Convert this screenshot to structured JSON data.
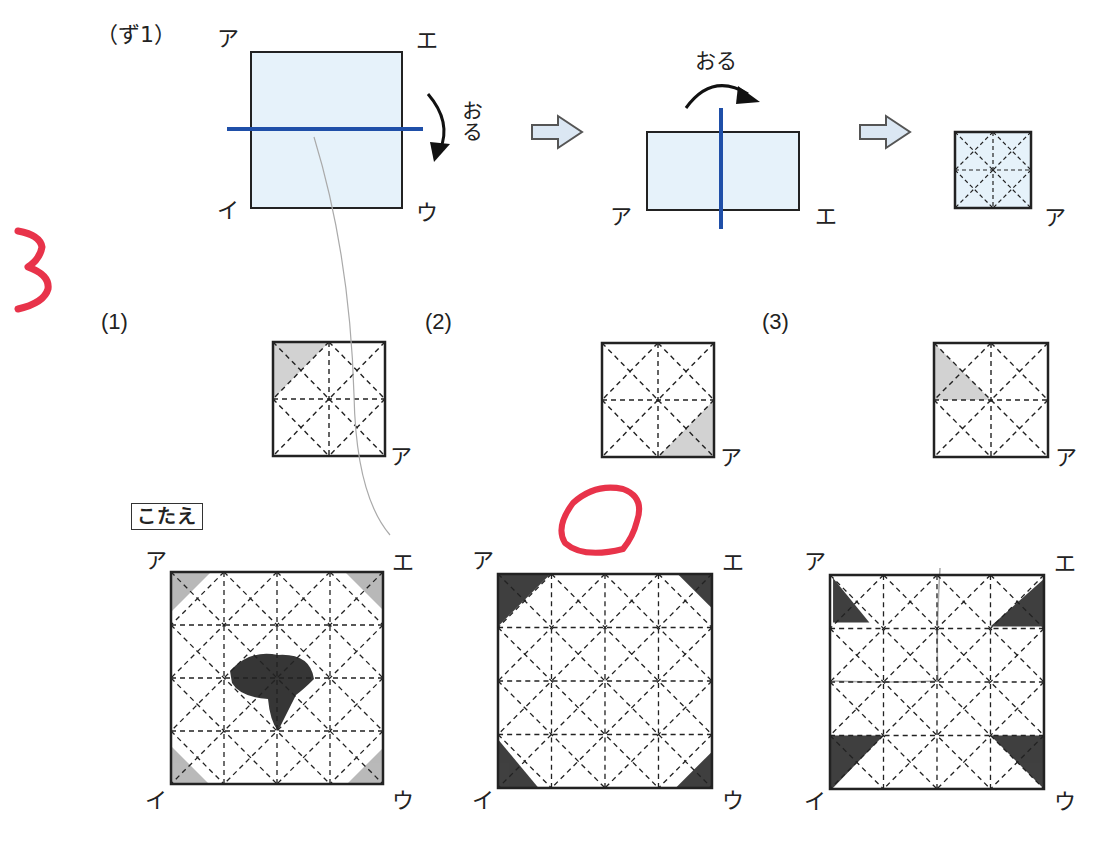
{
  "figure": {
    "title": "（ず1）",
    "fold_label": "おる",
    "step1": {
      "corners": {
        "top_left": "ア",
        "top_right": "エ",
        "bottom_left": "イ",
        "bottom_right": "ウ"
      }
    },
    "step2": {
      "corners": {
        "bottom_left": "ア",
        "bottom_right": "エ"
      }
    },
    "step3": {
      "corner": "ア"
    },
    "colors": {
      "paper": "#e6f2fa",
      "fold_line": "#1f4fa8",
      "arrow_fill": "#dbe7f3",
      "shade": "#d2d2d2"
    }
  },
  "problem_number_mark": "3",
  "questions": [
    {
      "label": "(1)",
      "corner": "ア",
      "shaded": "top-left corner triangle (top-left, top-mid, left-mid)"
    },
    {
      "label": "(2)",
      "corner": "ア",
      "shaded": "bottom-right corner triangle (bottom-right, right-mid, bottom-mid)"
    },
    {
      "label": "(3)",
      "corner": "ア",
      "shaded": "triangle (top-left, left-mid, center)"
    }
  ],
  "answer_heading": "こたえ",
  "answers": [
    {
      "corners": {
        "top_left": "ア",
        "top_right": "エ",
        "bottom_left": "イ",
        "bottom_right": "ウ"
      },
      "marked": "center region + four corners (handwritten)"
    },
    {
      "corners": {
        "top_left": "ア",
        "top_right": "エ",
        "bottom_left": "イ",
        "bottom_right": "ウ"
      },
      "marked": "four corner triangles",
      "graded": "correct (red circle)"
    },
    {
      "corners": {
        "top_left": "ア",
        "top_right": "エ",
        "bottom_left": "イ",
        "bottom_right": "ウ"
      },
      "marked": "four corner triangles (larger)"
    }
  ]
}
